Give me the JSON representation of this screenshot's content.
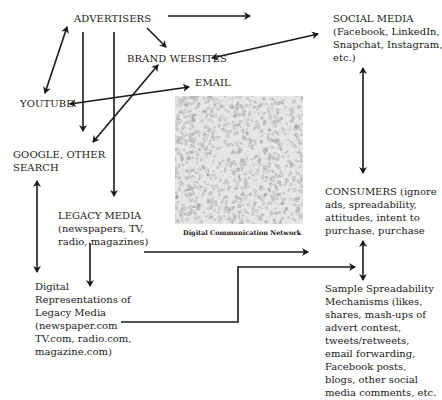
{
  "diagram": {
    "nodes": {
      "advertisers": "ADVERTISERS",
      "brand_websites": "BRAND WEBSITES",
      "email": "EMAIL",
      "youtube": "YOUTUBE",
      "google": [
        "GOOGLE, OTHER",
        "SEARCH"
      ],
      "social_media": [
        "SOCIAL MEDIA",
        "(Facebook, LinkedIn,",
        "Snapchat, Instagram,",
        "etc.)"
      ],
      "legacy_media": [
        "LEGACY MEDIA",
        "(newspapers, TV,",
        "radio, magazines)"
      ],
      "consumers": [
        "CONSUMERS (ignore",
        "ads, spreadability,",
        "attitudes, intent to",
        "purchase, purchase"
      ],
      "digital_representations": [
        "Digital",
        "Representations of",
        "Legacy Media",
        "(newspaper.com",
        "TV.com, radio.com,",
        "magazine.com)"
      ],
      "spreadability": [
        "Sample Spreadability",
        "Mechanisms (likes,",
        "shares, mash-ups of",
        "advert contest,",
        "tweets/retweets,",
        "email forwarding,",
        "Facebook posts,",
        "blogs, other social",
        "media comments, etc."
      ]
    },
    "network_caption": "Digital Communication Network",
    "colors": {
      "ink": "#1a1a1a",
      "network_bg": "#e6e6e6",
      "network_node": "#9a9a9a"
    }
  }
}
